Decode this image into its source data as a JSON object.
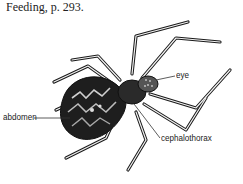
{
  "caption": "Feeding, p. 293.",
  "figure": {
    "labels": {
      "eye": "eye",
      "abdomen": "abdomen",
      "cephalothorax": "cephalothorax"
    }
  },
  "colors": {
    "ink": "#1a1a1a",
    "background": "#ffffff"
  }
}
